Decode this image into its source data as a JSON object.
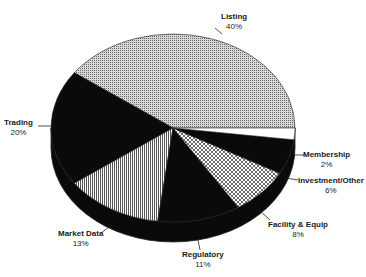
{
  "chart_data": {
    "type": "pie",
    "style": "3d",
    "title": "",
    "categories": [
      "Listing",
      "Trading",
      "Market Data",
      "Regulatory",
      "Facility & Equip",
      "Investment/Other",
      "Membership"
    ],
    "values": [
      40,
      20,
      13,
      11,
      8,
      6,
      2
    ],
    "value_labels": [
      "40%",
      "20%",
      "13%",
      "11%",
      "8%",
      "6%",
      "2%"
    ],
    "start_angle_deg": 0,
    "direction": "counter-clockwise",
    "fills": [
      "fine-dot-gray",
      "black",
      "vertical-lines",
      "black",
      "crosshatch",
      "black",
      "white"
    ],
    "legend": "none"
  },
  "labels": [
    {
      "name": "Listing",
      "pct": "40%"
    },
    {
      "name": "Trading",
      "pct": "20%"
    },
    {
      "name": "Market Data",
      "pct": "13%"
    },
    {
      "name": "Regulatory",
      "pct": "11%"
    },
    {
      "name": "Facility & Equip",
      "pct": "8%"
    },
    {
      "name": "Investment/Other",
      "pct": "6%"
    },
    {
      "name": "Membership",
      "pct": "2%"
    }
  ]
}
